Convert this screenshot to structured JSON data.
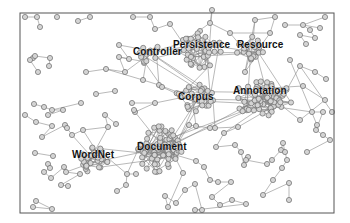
{
  "diagram": {
    "type": "network-graph",
    "frame": {
      "x": 20,
      "y": 13,
      "w": 314,
      "h": 200
    },
    "colors": {
      "node_fill": "#d4d4d4",
      "node_stroke": "#6a6a6a",
      "edge": "#8a8a8a",
      "label": "#111111",
      "frame": "#555555"
    },
    "labels": [
      {
        "id": "controller",
        "text": "Controller",
        "x": 133,
        "y": 52
      },
      {
        "id": "persistence",
        "text": "Persistence",
        "x": 173,
        "y": 45
      },
      {
        "id": "resource",
        "text": "Resource",
        "x": 237,
        "y": 45
      },
      {
        "id": "corpus",
        "text": "Corpus",
        "x": 178,
        "y": 97
      },
      {
        "id": "annotation",
        "text": "Annotation",
        "x": 233,
        "y": 91
      },
      {
        "id": "document",
        "text": "Document",
        "x": 137,
        "y": 147
      },
      {
        "id": "wordnet",
        "text": "WordNet",
        "x": 72,
        "y": 155
      }
    ],
    "clusters": [
      {
        "name": "persistence",
        "cx": 200,
        "cy": 50,
        "rx": 22,
        "ry": 18,
        "n": 34,
        "seed": 3
      },
      {
        "name": "resource",
        "cx": 250,
        "cy": 48,
        "rx": 14,
        "ry": 14,
        "n": 18,
        "seed": 7
      },
      {
        "name": "controller",
        "cx": 150,
        "cy": 55,
        "rx": 14,
        "ry": 10,
        "n": 14,
        "seed": 11
      },
      {
        "name": "annotation",
        "cx": 262,
        "cy": 98,
        "rx": 30,
        "ry": 18,
        "n": 60,
        "seed": 17
      },
      {
        "name": "corpus",
        "cx": 195,
        "cy": 98,
        "rx": 20,
        "ry": 14,
        "n": 28,
        "seed": 23
      },
      {
        "name": "document",
        "cx": 160,
        "cy": 150,
        "rx": 22,
        "ry": 24,
        "n": 70,
        "seed": 29
      },
      {
        "name": "wordnet",
        "cx": 95,
        "cy": 160,
        "rx": 14,
        "ry": 14,
        "n": 28,
        "seed": 31
      }
    ],
    "nodes": [
      [
        25,
        17
      ],
      [
        37,
        17
      ],
      [
        57,
        17
      ],
      [
        40,
        27
      ],
      [
        78,
        21
      ],
      [
        90,
        17
      ],
      [
        133,
        17
      ],
      [
        150,
        17
      ],
      [
        155,
        29
      ],
      [
        170,
        24
      ],
      [
        285,
        25
      ],
      [
        303,
        25
      ],
      [
        325,
        17
      ],
      [
        310,
        30
      ],
      [
        315,
        38
      ],
      [
        300,
        35
      ],
      [
        306,
        44
      ],
      [
        320,
        28
      ],
      [
        33,
        58
      ],
      [
        30,
        60
      ],
      [
        35,
        56
      ],
      [
        50,
        58
      ],
      [
        49,
        66
      ],
      [
        38,
        72
      ],
      [
        86,
        72
      ],
      [
        106,
        69
      ],
      [
        125,
        72
      ],
      [
        119,
        57
      ],
      [
        129,
        59
      ],
      [
        119,
        45
      ],
      [
        143,
        80
      ],
      [
        159,
        85
      ],
      [
        162,
        87
      ],
      [
        96,
        94
      ],
      [
        115,
        91
      ],
      [
        132,
        103
      ],
      [
        155,
        103
      ],
      [
        135,
        112
      ],
      [
        134,
        110
      ],
      [
        34,
        104
      ],
      [
        44,
        107
      ],
      [
        52,
        110
      ],
      [
        63,
        110
      ],
      [
        48,
        115
      ],
      [
        81,
        103
      ],
      [
        25,
        115
      ],
      [
        36,
        122
      ],
      [
        52,
        126
      ],
      [
        42,
        137
      ],
      [
        65,
        125
      ],
      [
        67,
        128
      ],
      [
        72,
        135
      ],
      [
        83,
        130
      ],
      [
        108,
        127
      ],
      [
        105,
        115
      ],
      [
        116,
        124
      ],
      [
        48,
        164
      ],
      [
        50,
        168
      ],
      [
        44,
        172
      ],
      [
        51,
        178
      ],
      [
        64,
        167
      ],
      [
        66,
        172
      ],
      [
        80,
        174
      ],
      [
        61,
        185
      ],
      [
        68,
        186
      ],
      [
        127,
        174
      ],
      [
        126,
        185
      ],
      [
        117,
        191
      ],
      [
        136,
        174
      ],
      [
        35,
        153
      ],
      [
        53,
        156
      ],
      [
        36,
        201
      ],
      [
        52,
        209
      ],
      [
        33,
        207
      ],
      [
        189,
        125
      ],
      [
        196,
        126
      ],
      [
        210,
        128
      ],
      [
        215,
        128
      ],
      [
        238,
        127
      ],
      [
        224,
        133
      ],
      [
        216,
        147
      ],
      [
        235,
        145
      ],
      [
        241,
        152
      ],
      [
        244,
        165
      ],
      [
        248,
        157
      ],
      [
        246,
        160
      ],
      [
        267,
        164
      ],
      [
        272,
        160
      ],
      [
        281,
        150
      ],
      [
        283,
        143
      ],
      [
        285,
        152
      ],
      [
        287,
        160
      ],
      [
        282,
        168
      ],
      [
        273,
        180
      ],
      [
        263,
        195
      ],
      [
        289,
        183
      ],
      [
        289,
        200
      ],
      [
        196,
        161
      ],
      [
        204,
        167
      ],
      [
        210,
        180
      ],
      [
        218,
        182
      ],
      [
        231,
        182
      ],
      [
        212,
        197
      ],
      [
        220,
        205
      ],
      [
        232,
        200
      ],
      [
        246,
        204
      ],
      [
        195,
        210
      ],
      [
        202,
        210
      ],
      [
        195,
        184
      ],
      [
        185,
        190
      ],
      [
        176,
        203
      ],
      [
        165,
        196
      ],
      [
        168,
        207
      ],
      [
        183,
        173
      ],
      [
        250,
        55
      ],
      [
        245,
        72
      ],
      [
        255,
        20
      ],
      [
        275,
        17
      ],
      [
        270,
        33
      ],
      [
        230,
        33
      ],
      [
        210,
        23
      ],
      [
        212,
        10
      ],
      [
        300,
        66
      ],
      [
        315,
        72
      ],
      [
        326,
        79
      ],
      [
        312,
        112
      ],
      [
        323,
        112
      ],
      [
        316,
        130
      ],
      [
        323,
        135
      ],
      [
        330,
        140
      ],
      [
        307,
        152
      ],
      [
        317,
        125
      ],
      [
        290,
        60
      ],
      [
        303,
        86
      ],
      [
        325,
        100
      ],
      [
        300,
        120
      ],
      [
        332,
        112
      ],
      [
        183,
        40
      ],
      [
        200,
        31
      ]
    ],
    "edges": [
      [
        0,
        1
      ],
      [
        1,
        3
      ],
      [
        4,
        5
      ],
      [
        6,
        7
      ],
      [
        7,
        8
      ],
      [
        8,
        9
      ],
      [
        10,
        11
      ],
      [
        11,
        12
      ],
      [
        11,
        13
      ],
      [
        13,
        14
      ],
      [
        14,
        15
      ],
      [
        15,
        16
      ],
      [
        11,
        17
      ],
      [
        18,
        19
      ],
      [
        19,
        20
      ],
      [
        20,
        21
      ],
      [
        21,
        22
      ],
      [
        19,
        23
      ],
      [
        24,
        25
      ],
      [
        25,
        26
      ],
      [
        26,
        27
      ],
      [
        27,
        28
      ],
      [
        28,
        29
      ],
      [
        25,
        30
      ],
      [
        30,
        31
      ],
      [
        31,
        32
      ],
      [
        33,
        34
      ],
      [
        35,
        36
      ],
      [
        36,
        37
      ],
      [
        37,
        38
      ],
      [
        39,
        40
      ],
      [
        40,
        41
      ],
      [
        41,
        42
      ],
      [
        42,
        43
      ],
      [
        41,
        44
      ],
      [
        45,
        46
      ],
      [
        46,
        47
      ],
      [
        47,
        48
      ],
      [
        48,
        49
      ],
      [
        49,
        50
      ],
      [
        50,
        51
      ],
      [
        51,
        52
      ],
      [
        52,
        53
      ],
      [
        53,
        54
      ],
      [
        54,
        55
      ],
      [
        56,
        57
      ],
      [
        57,
        58
      ],
      [
        58,
        59
      ],
      [
        59,
        60
      ],
      [
        60,
        61
      ],
      [
        61,
        62
      ],
      [
        62,
        63
      ],
      [
        63,
        64
      ],
      [
        65,
        66
      ],
      [
        66,
        67
      ],
      [
        65,
        68
      ],
      [
        69,
        70
      ],
      [
        71,
        72
      ],
      [
        72,
        73
      ],
      [
        74,
        75
      ],
      [
        75,
        76
      ],
      [
        76,
        77
      ],
      [
        77,
        78
      ],
      [
        78,
        79
      ],
      [
        79,
        80
      ],
      [
        80,
        81
      ],
      [
        81,
        82
      ],
      [
        82,
        83
      ],
      [
        83,
        84
      ],
      [
        84,
        85
      ],
      [
        85,
        86
      ],
      [
        86,
        87
      ],
      [
        87,
        88
      ],
      [
        88,
        89
      ],
      [
        89,
        90
      ],
      [
        90,
        91
      ],
      [
        91,
        92
      ],
      [
        92,
        93
      ],
      [
        93,
        94
      ],
      [
        94,
        95
      ],
      [
        95,
        96
      ],
      [
        97,
        98
      ],
      [
        98,
        99
      ],
      [
        99,
        100
      ],
      [
        100,
        101
      ],
      [
        101,
        102
      ],
      [
        102,
        103
      ],
      [
        103,
        104
      ],
      [
        104,
        105
      ],
      [
        105,
        106
      ],
      [
        106,
        107
      ],
      [
        107,
        108
      ],
      [
        108,
        109
      ],
      [
        109,
        110
      ],
      [
        110,
        111
      ],
      [
        111,
        112
      ],
      [
        112,
        113
      ],
      [
        114,
        115
      ],
      [
        115,
        116
      ],
      [
        116,
        117
      ],
      [
        117,
        118
      ],
      [
        118,
        119
      ],
      [
        119,
        120
      ],
      [
        120,
        121
      ],
      [
        122,
        123
      ],
      [
        123,
        124
      ],
      [
        125,
        126
      ],
      [
        126,
        127
      ],
      [
        127,
        128
      ],
      [
        128,
        129
      ],
      [
        129,
        130
      ],
      [
        131,
        132
      ],
      [
        133,
        134
      ],
      [
        134,
        135
      ],
      [
        136,
        122
      ]
    ],
    "bridges": [
      [
        "controller",
        "persistence"
      ],
      [
        "persistence",
        "resource"
      ],
      [
        "persistence",
        "corpus"
      ],
      [
        "resource",
        "annotation"
      ],
      [
        "corpus",
        "annotation"
      ],
      [
        "corpus",
        "document"
      ],
      [
        "document",
        "wordnet"
      ],
      [
        "controller",
        "corpus"
      ],
      [
        "annotation",
        "document"
      ]
    ]
  }
}
